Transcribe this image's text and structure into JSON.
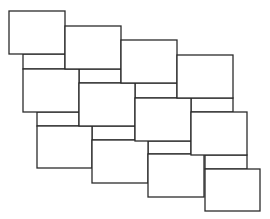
{
  "diagram": {
    "type": "staggered-rectangle-tiling",
    "stroke_color": "#2b2b2b",
    "fill_color": "#ffffff",
    "background": "#ffffff",
    "rows": [
      {
        "name": "row-1",
        "tiles": [
          {
            "x": 9,
            "y": 11,
            "w": 56,
            "h": 43
          },
          {
            "x": 65,
            "y": 26,
            "w": 56,
            "h": 43
          },
          {
            "x": 121,
            "y": 40,
            "w": 56,
            "h": 43
          },
          {
            "x": 177,
            "y": 55,
            "w": 56,
            "h": 43
          }
        ]
      },
      {
        "name": "row-2",
        "tiles": [
          {
            "x": 23,
            "y": 69,
            "w": 56,
            "h": 43
          },
          {
            "x": 79,
            "y": 83,
            "w": 56,
            "h": 43
          },
          {
            "x": 135,
            "y": 98,
            "w": 56,
            "h": 43
          },
          {
            "x": 191,
            "y": 112,
            "w": 56,
            "h": 43
          }
        ]
      },
      {
        "name": "row-3",
        "tiles": [
          {
            "x": 37,
            "y": 126,
            "w": 55,
            "h": 42
          },
          {
            "x": 92,
            "y": 140,
            "w": 56,
            "h": 43
          },
          {
            "x": 148,
            "y": 154,
            "w": 56,
            "h": 43
          },
          {
            "x": 205,
            "y": 169,
            "w": 55,
            "h": 42
          }
        ]
      }
    ],
    "strips": [
      {
        "x": 23,
        "y": 54,
        "w": 42,
        "h": 15
      },
      {
        "x": 79,
        "y": 69,
        "w": 42,
        "h": 14
      },
      {
        "x": 135,
        "y": 83,
        "w": 42,
        "h": 15
      },
      {
        "x": 191,
        "y": 98,
        "w": 42,
        "h": 14
      },
      {
        "x": 37,
        "y": 112,
        "w": 42,
        "h": 14
      },
      {
        "x": 92,
        "y": 126,
        "w": 43,
        "h": 14
      },
      {
        "x": 148,
        "y": 141,
        "w": 43,
        "h": 13
      },
      {
        "x": 205,
        "y": 155,
        "w": 42,
        "h": 14
      }
    ]
  }
}
